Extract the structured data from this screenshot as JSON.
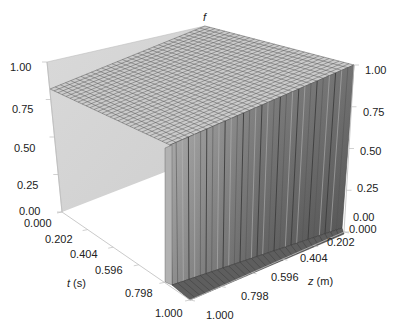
{
  "chart_data": {
    "type": "surface3d",
    "title": "",
    "zlabel": "f",
    "xlabel": "t (s)",
    "ylabel": "z (m)",
    "x_axis": {
      "name": "t",
      "unit": "s",
      "ticks": [
        "0.000",
        "0.202",
        "0.404",
        "0.596",
        "0.798",
        "1.000"
      ],
      "range": [
        0,
        1
      ]
    },
    "y_axis": {
      "name": "z",
      "unit": "m",
      "ticks": [
        "0.000",
        "0.202",
        "0.404",
        "0.596",
        "0.798",
        "1.000"
      ],
      "range": [
        0,
        1
      ]
    },
    "f_axis": {
      "name": "f",
      "ticks": [
        "0.00",
        "0.25",
        "0.50",
        "0.75",
        "1.00"
      ],
      "range": [
        0,
        1
      ]
    },
    "surface": {
      "plateau_value": 1.0,
      "step_at_t": 1.0,
      "low_value": 0.0,
      "grid": {
        "t_lines": 30,
        "z_lines": 30
      }
    },
    "colors": {
      "plateau": "#c9c9c9",
      "plateau_grid": "#5a5a5a",
      "wall_light": "#9a9a9a",
      "wall_dark": "#4a4a4a",
      "back_pane": "#d6d6d6",
      "axis_line": "#bdbdbd"
    }
  },
  "labels": {
    "f_title": "f",
    "t_title_var": "t",
    "t_title_unit": " (s)",
    "z_title_var": "z",
    "z_title_unit": " (m)",
    "left_f_ticks": [
      "1.00",
      "0.75",
      "0.50",
      "0.25",
      "0.00"
    ],
    "right_f_ticks": [
      "1.00",
      "0.75",
      "0.50",
      "0.25",
      "0.00"
    ],
    "t_ticks": [
      "0.000",
      "0.202",
      "0.404",
      "0.596",
      "0.798",
      "1.000"
    ],
    "z_ticks": [
      "0.000",
      "0.202",
      "0.404",
      "0.596",
      "0.798",
      "1.000"
    ]
  }
}
